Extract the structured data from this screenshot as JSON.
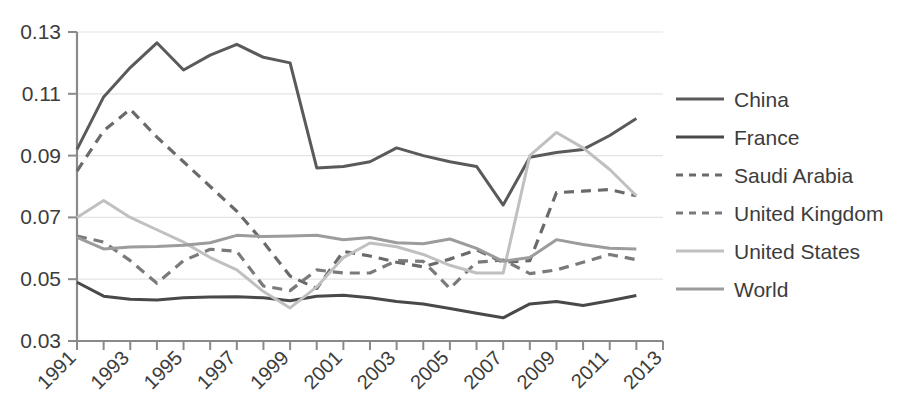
{
  "chart_data": {
    "type": "line",
    "title": "",
    "xlabel": "",
    "ylabel": "",
    "grid": true,
    "legend_position": "right",
    "xlim": [
      1991,
      2013
    ],
    "ylim": [
      0.03,
      0.13
    ],
    "x": [
      1991,
      1992,
      1993,
      1994,
      1995,
      1996,
      1997,
      1998,
      1999,
      2000,
      2001,
      2002,
      2003,
      2004,
      2005,
      2006,
      2007,
      2008,
      2009,
      2010,
      2011,
      2012
    ],
    "y_ticks": [
      0.03,
      0.05,
      0.07,
      0.09,
      0.11,
      0.13
    ],
    "y_tick_labels": [
      "0.03",
      "0.05",
      "0.07",
      "0.09",
      "0.11",
      "0.13"
    ],
    "x_ticks": [
      1991,
      1993,
      1995,
      1997,
      1999,
      2001,
      2003,
      2005,
      2007,
      2009,
      2011,
      2013
    ],
    "x_tick_labels": [
      "1991",
      "1993",
      "1995",
      "1997",
      "1999",
      "2001",
      "2003",
      "2005",
      "2007",
      "2009",
      "2011",
      "2013"
    ],
    "x_minor_ticks": [
      1992,
      1994,
      1996,
      1998,
      2000,
      2002,
      2004,
      2006,
      2008,
      2010,
      2012
    ],
    "series": [
      {
        "name": "China",
        "style": "solid",
        "color": "#5a5a5a",
        "width": 3.0,
        "values": [
          0.092,
          0.109,
          0.1185,
          0.1265,
          0.1177,
          0.1225,
          0.126,
          0.1218,
          0.12,
          0.086,
          0.0865,
          0.088,
          0.0925,
          0.09,
          0.088,
          0.0865,
          0.074,
          0.0895,
          0.091,
          0.092,
          0.0965,
          0.102
        ]
      },
      {
        "name": "France",
        "style": "solid",
        "color": "#494949",
        "width": 3.0,
        "values": [
          0.049,
          0.0445,
          0.0435,
          0.0433,
          0.044,
          0.0442,
          0.0443,
          0.044,
          0.043,
          0.0445,
          0.0448,
          0.044,
          0.0428,
          0.042,
          0.0405,
          0.039,
          0.0375,
          0.042,
          0.0428,
          0.0415,
          0.043,
          0.0447
        ]
      },
      {
        "name": "Saudi Arabia",
        "style": "dashed",
        "color": "#6a6a6a",
        "width": 3.2,
        "values": [
          0.085,
          0.098,
          0.105,
          0.096,
          0.088,
          0.08,
          0.072,
          0.062,
          0.051,
          0.047,
          0.059,
          0.0575,
          0.0555,
          0.054,
          0.0565,
          0.0595,
          0.0555,
          0.056,
          0.078,
          0.0785,
          0.079,
          0.077
        ]
      },
      {
        "name": "United Kingdom",
        "style": "dashed",
        "color": "#7a7a7a",
        "width": 3.2,
        "values": [
          0.064,
          0.062,
          0.056,
          0.0487,
          0.056,
          0.0597,
          0.059,
          0.0478,
          0.0463,
          0.053,
          0.052,
          0.052,
          0.056,
          0.0558,
          0.047,
          0.0555,
          0.0562,
          0.0518,
          0.053,
          0.0555,
          0.058,
          0.0563
        ]
      },
      {
        "name": "United States",
        "style": "solid",
        "color": "#c0c0c0",
        "width": 3.0,
        "values": [
          0.07,
          0.0755,
          0.07,
          0.066,
          0.062,
          0.057,
          0.053,
          0.046,
          0.0407,
          0.0475,
          0.057,
          0.0617,
          0.0605,
          0.058,
          0.0545,
          0.052,
          0.052,
          0.09,
          0.0975,
          0.0925,
          0.0855,
          0.077
        ]
      },
      {
        "name": "World",
        "style": "solid",
        "color": "#9c9c9c",
        "width": 3.0,
        "values": [
          0.0635,
          0.0598,
          0.0604,
          0.0606,
          0.061,
          0.0618,
          0.0642,
          0.0638,
          0.064,
          0.0642,
          0.0628,
          0.0635,
          0.0618,
          0.0615,
          0.063,
          0.06,
          0.0558,
          0.057,
          0.0628,
          0.0612,
          0.06,
          0.0598
        ]
      }
    ]
  },
  "legend": {
    "items": [
      {
        "label": "China"
      },
      {
        "label": "France"
      },
      {
        "label": "Saudi Arabia"
      },
      {
        "label": "United Kingdom"
      },
      {
        "label": "United States"
      },
      {
        "label": "World"
      }
    ]
  }
}
